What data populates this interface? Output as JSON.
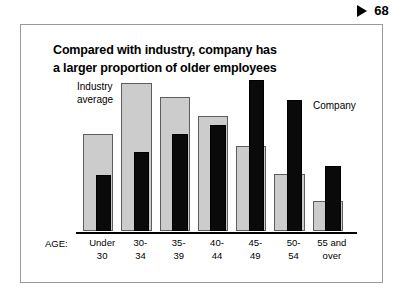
{
  "page": {
    "marker_icon": "triangle-right-icon",
    "number": "68"
  },
  "slide": {
    "title_line1": "Compared with industry, company has",
    "title_line2": "a larger proportion of older employees"
  },
  "legend": {
    "industry_line1": "Industry",
    "industry_line2": "average",
    "company": "Company",
    "industry_color": "#cccccc",
    "company_color": "#0a0a0a"
  },
  "axis": {
    "label": "AGE:"
  },
  "chart_data": {
    "type": "bar",
    "title": "Compared with industry, company has a larger proportion of older employees",
    "xlabel": "AGE:",
    "ylabel": "",
    "grid": false,
    "legend_position": "inline-annotations",
    "ylim": [
      0,
      100
    ],
    "categories": [
      "Under 30",
      "30-34",
      "35-39",
      "40-44",
      "45-49",
      "50-54",
      "55 and over"
    ],
    "category_lines": [
      [
        "Under",
        "30"
      ],
      [
        "30-",
        "34"
      ],
      [
        "35-",
        "39"
      ],
      [
        "40-",
        "44"
      ],
      [
        "45-",
        "49"
      ],
      [
        "50-",
        "54"
      ],
      [
        "55 and",
        "over"
      ]
    ],
    "series": [
      {
        "name": "Industry average",
        "color": "#cccccc",
        "values": [
          64,
          98,
          89,
          76,
          56,
          38,
          20
        ]
      },
      {
        "name": "Company",
        "color": "#0a0a0a",
        "values": [
          37,
          52,
          64,
          70,
          100,
          87,
          43
        ]
      }
    ]
  }
}
